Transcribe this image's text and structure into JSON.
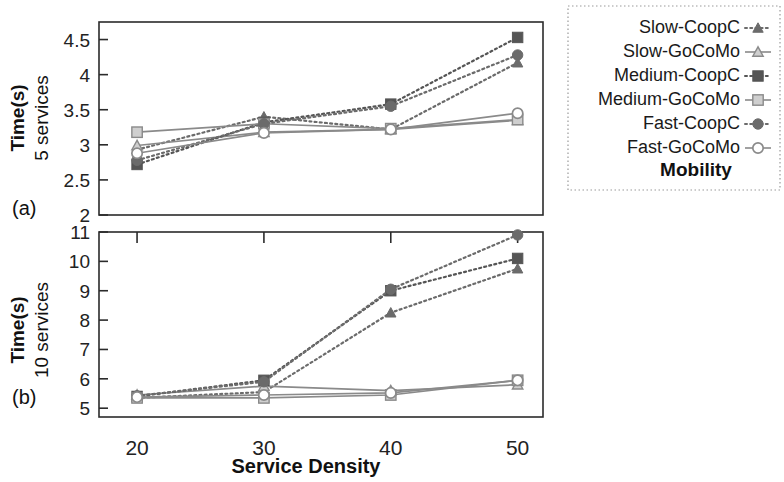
{
  "figure": {
    "xaxis_title": "Service Density",
    "legend_title": "Mobility",
    "panel_a_tag": "(a)",
    "panel_b_tag": "(b)",
    "panel_a_ylabel_bold": "Time(s)",
    "panel_a_ylabel_plain": "5 services",
    "panel_b_ylabel_bold": "Time(s)",
    "panel_b_ylabel_plain": "10 services"
  },
  "legend": {
    "title": "Mobility",
    "entries": [
      {
        "label": "Slow-CoopC",
        "marker": "triangle-filled",
        "line": "dotted",
        "color": "#6b6b6b"
      },
      {
        "label": "Slow-GoCoMo",
        "marker": "triangle-open",
        "line": "solid",
        "color": "#8a8a8a"
      },
      {
        "label": "Medium-CoopC",
        "marker": "square-filled",
        "line": "dotted",
        "color": "#555555"
      },
      {
        "label": "Medium-GoCoMo",
        "marker": "square-open",
        "line": "solid",
        "color": "#8a8a8a"
      },
      {
        "label": "Fast-CoopC",
        "marker": "circle-filled",
        "line": "dotted",
        "color": "#6b6b6b"
      },
      {
        "label": "Fast-GoCoMo",
        "marker": "circle-open",
        "line": "solid",
        "color": "#8a8a8a"
      }
    ]
  },
  "chart_data": [
    {
      "type": "line",
      "panel": "(a)",
      "title": "",
      "xlabel": "Service Density",
      "ylabel": "Time(s) 5 services",
      "x": [
        20,
        30,
        40,
        50
      ],
      "xticks": [
        "20",
        "30",
        "40",
        "50"
      ],
      "yticks": [
        "2",
        "2.5",
        "3",
        "3.5",
        "4",
        "4.5"
      ],
      "xlim": [
        17,
        52
      ],
      "ylim": [
        2,
        4.75
      ],
      "grid": false,
      "legend_position": "right",
      "series": [
        {
          "name": "Slow-CoopC",
          "values": [
            2.93,
            3.4,
            3.22,
            4.17
          ],
          "line": "dotted",
          "marker": "triangle-filled",
          "color": "#6b6b6b"
        },
        {
          "name": "Slow-GoCoMo",
          "values": [
            2.99,
            3.18,
            3.22,
            3.35
          ],
          "line": "solid",
          "marker": "triangle-open",
          "color": "#8a8a8a"
        },
        {
          "name": "Medium-CoopC",
          "values": [
            2.72,
            3.32,
            3.58,
            4.53
          ],
          "line": "dotted",
          "marker": "square-filled",
          "color": "#555555"
        },
        {
          "name": "Medium-GoCoMo",
          "values": [
            3.18,
            3.3,
            3.23,
            3.36
          ],
          "line": "solid",
          "marker": "square-open",
          "color": "#8a8a8a"
        },
        {
          "name": "Fast-CoopC",
          "values": [
            2.78,
            3.3,
            3.55,
            4.28
          ],
          "line": "dotted",
          "marker": "circle-filled",
          "color": "#6b6b6b"
        },
        {
          "name": "Fast-GoCoMo",
          "values": [
            2.88,
            3.17,
            3.22,
            3.45
          ],
          "line": "solid",
          "marker": "circle-open",
          "color": "#8a8a8a"
        }
      ]
    },
    {
      "type": "line",
      "panel": "(b)",
      "title": "",
      "xlabel": "Service Density",
      "ylabel": "Time(s) 10 services",
      "x": [
        20,
        30,
        40,
        50
      ],
      "xticks": [
        "20",
        "30",
        "40",
        "50"
      ],
      "yticks": [
        "5",
        "6",
        "7",
        "8",
        "9",
        "10",
        "11"
      ],
      "xlim": [
        17,
        52
      ],
      "ylim": [
        4.7,
        11
      ],
      "grid": false,
      "legend_position": "right",
      "series": [
        {
          "name": "Slow-CoopC",
          "values": [
            5.35,
            5.55,
            8.25,
            9.75
          ],
          "line": "dotted",
          "marker": "triangle-filled",
          "color": "#6b6b6b"
        },
        {
          "name": "Slow-GoCoMo",
          "values": [
            5.45,
            5.75,
            5.6,
            5.8
          ],
          "line": "solid",
          "marker": "triangle-open",
          "color": "#8a8a8a"
        },
        {
          "name": "Medium-CoopC",
          "values": [
            5.4,
            5.95,
            9.0,
            10.1
          ],
          "line": "dotted",
          "marker": "square-filled",
          "color": "#555555"
        },
        {
          "name": "Medium-GoCoMo",
          "values": [
            5.35,
            5.35,
            5.45,
            5.95
          ],
          "line": "solid",
          "marker": "square-open",
          "color": "#8a8a8a"
        },
        {
          "name": "Fast-CoopC",
          "values": [
            5.42,
            5.9,
            9.05,
            10.9
          ],
          "line": "dotted",
          "marker": "circle-filled",
          "color": "#6b6b6b"
        },
        {
          "name": "Fast-GoCoMo",
          "values": [
            5.38,
            5.45,
            5.52,
            5.95
          ],
          "line": "solid",
          "marker": "circle-open",
          "color": "#8a8a8a"
        }
      ]
    }
  ]
}
